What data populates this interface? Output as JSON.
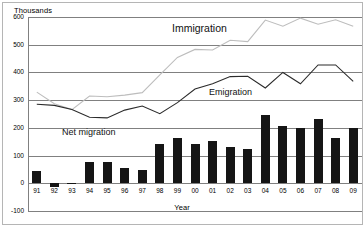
{
  "chart_data": {
    "type": "bar",
    "title": "",
    "xlabel": "Year",
    "ylabel": "Thousands",
    "ylim": [
      -100,
      600
    ],
    "yticks": [
      600,
      500,
      400,
      300,
      200,
      100,
      0,
      -100
    ],
    "grid": true,
    "legend_position": "inline-annotations",
    "categories": [
      "91",
      "92",
      "93",
      "94",
      "95",
      "96",
      "97",
      "98",
      "99",
      "00",
      "01",
      "02",
      "03",
      "04",
      "05",
      "06",
      "07",
      "08",
      "09"
    ],
    "series": [
      {
        "name": "Net migration",
        "type": "bar",
        "color": "#151515",
        "values": [
          43,
          -13,
          1,
          77,
          76,
          55,
          48,
          140,
          163,
          143,
          151,
          131,
          125,
          245,
          206,
          198,
          233,
          163,
          198
        ]
      },
      {
        "name": "Immigration",
        "type": "line",
        "color": "#bdbdbd",
        "values": [
          329,
          287,
          266,
          315,
          312,
          318,
          327,
          391,
          454,
          483,
          481,
          516,
          511,
          589,
          567,
          596,
          574,
          590,
          567
        ]
      },
      {
        "name": "Emigration",
        "type": "line",
        "color": "#2b2b2b",
        "values": [
          285,
          281,
          266,
          238,
          236,
          264,
          279,
          251,
          291,
          340,
          359,
          385,
          386,
          344,
          400,
          359,
          427,
          427,
          368
        ]
      }
    ],
    "annotations": [
      {
        "text": "Immigration",
        "series": "Immigration"
      },
      {
        "text": "Emigration",
        "series": "Emigration"
      },
      {
        "text": "Net migration",
        "series": "Net migration"
      }
    ]
  }
}
